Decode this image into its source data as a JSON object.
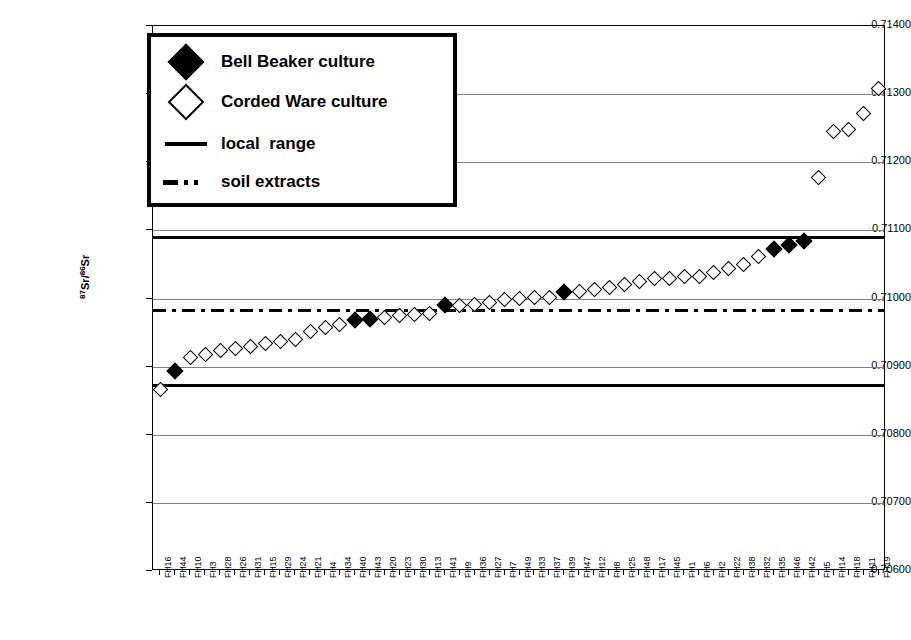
{
  "chart_data": {
    "type": "scatter",
    "title": "",
    "xlabel": "",
    "ylabel": "87Sr/86Sr",
    "ylabel_sup_a": "87",
    "ylabel_mid": "Sr/",
    "ylabel_sup_b": "86",
    "ylabel_end": "Sr",
    "ylim": [
      0.706,
      0.714
    ],
    "ytick_labels": [
      "0.71400",
      "0.71300",
      "0.71200",
      "0.71100",
      "0.71000",
      "0.70900",
      "0.70800",
      "0.70700",
      "0.70600"
    ],
    "ytick_values": [
      0.714,
      0.713,
      0.712,
      0.711,
      0.71,
      0.709,
      0.708,
      0.707,
      0.706
    ],
    "grid": true,
    "grid_axis": "y",
    "legend_position": "top-left",
    "categories": [
      "FH16",
      "FH44",
      "FH10",
      "FH3",
      "FH28",
      "FH26",
      "FH31",
      "FH15",
      "FH29",
      "FH24",
      "FH21",
      "FH4",
      "FH34",
      "FH40",
      "FH43",
      "FH20",
      "FH23",
      "FH30",
      "FH13",
      "FH41",
      "FH9",
      "FH36",
      "FH27",
      "FH7",
      "FH49",
      "FH33",
      "FH37",
      "FH39",
      "FH47",
      "FH12",
      "FH8",
      "FH25",
      "FH48",
      "FH17",
      "FH45",
      "FH1",
      "FH6",
      "FH2",
      "FH22",
      "FH38",
      "FH32",
      "FH35",
      "FH46",
      "FH42",
      "FH5",
      "FH14",
      "FH18",
      "FH11",
      "FH19"
    ],
    "values": [
      0.70867,
      0.70893,
      0.70913,
      0.70918,
      0.70923,
      0.70927,
      0.7093,
      0.70934,
      0.70937,
      0.7094,
      0.70951,
      0.70957,
      0.70962,
      0.70968,
      0.7097,
      0.70972,
      0.70975,
      0.70977,
      0.70978,
      0.7099,
      0.7099,
      0.70991,
      0.70994,
      0.70998,
      0.71,
      0.71001,
      0.71002,
      0.7101,
      0.7101,
      0.71013,
      0.71016,
      0.71021,
      0.71025,
      0.71029,
      0.7103,
      0.71033,
      0.71033,
      0.71038,
      0.71044,
      0.7105,
      0.71062,
      0.71072,
      0.71079,
      0.71084,
      0.71178,
      0.71245,
      0.71248,
      0.71271,
      0.71308
    ],
    "series": [
      {
        "name": "Bell Beaker culture",
        "marker": "filled-diamond",
        "point_indices": [
          1,
          13,
          14,
          19,
          27,
          41,
          42,
          43
        ]
      },
      {
        "name": "Corded Ware culture",
        "marker": "open-diamond",
        "point_indices": [
          0,
          2,
          3,
          4,
          5,
          6,
          7,
          8,
          9,
          10,
          11,
          12,
          15,
          16,
          17,
          18,
          20,
          21,
          22,
          23,
          24,
          25,
          26,
          28,
          29,
          30,
          31,
          32,
          33,
          34,
          35,
          36,
          37,
          38,
          39,
          40,
          44,
          45,
          46,
          47,
          48
        ]
      }
    ],
    "reference_lines": [
      {
        "name": "local-range-upper",
        "value": 0.71091,
        "style": "solid",
        "label": "local  range"
      },
      {
        "name": "local-range-lower",
        "value": 0.70873,
        "style": "solid",
        "label": "local  range"
      },
      {
        "name": "soil-extracts",
        "value": 0.70983,
        "style": "dash-dot",
        "label": "soil extracts"
      }
    ],
    "colors": {
      "marker": "#000000",
      "line": "#000000",
      "grid": "#808080",
      "background": "#ffffff"
    }
  },
  "legend": {
    "items": [
      {
        "key": "filled-diamond",
        "label": "Bell Beaker culture"
      },
      {
        "key": "open-diamond",
        "label": "Corded Ware culture"
      },
      {
        "key": "solid-line",
        "label": "local  range"
      },
      {
        "key": "dashdot-line",
        "label": "soil extracts"
      }
    ]
  }
}
